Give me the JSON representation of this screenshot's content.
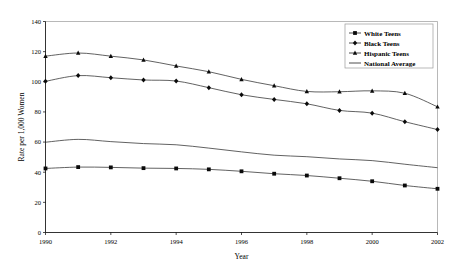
{
  "chart_data": {
    "type": "line",
    "title": "",
    "xlabel": "Year",
    "ylabel": "Rate per 1,000 Women",
    "x": [
      1990,
      1991,
      1992,
      1993,
      1994,
      1995,
      1996,
      1997,
      1998,
      1999,
      2000,
      2001,
      2002
    ],
    "xlim": [
      1990,
      2002
    ],
    "ylim": [
      0,
      140
    ],
    "xticks": [
      1990,
      1992,
      1994,
      1996,
      1998,
      2000,
      2002
    ],
    "xtick_labels": [
      "1990",
      "1992",
      "1994",
      "1996",
      "1998",
      "2000",
      "2002"
    ],
    "yticks": [
      0,
      20,
      40,
      60,
      80,
      100,
      120,
      140
    ],
    "ytick_labels": [
      "0",
      "20",
      "40",
      "60",
      "80",
      "100",
      "120",
      "140"
    ],
    "grid": false,
    "legend_position": "top-right",
    "series": [
      {
        "name": "White Teens",
        "marker": "square",
        "values": [
          42.5,
          43.4,
          43.2,
          42.7,
          42.5,
          41.9,
          40.6,
          39.0,
          37.8,
          36.0,
          34.0,
          31.2,
          29.0
        ]
      },
      {
        "name": "Black Teens",
        "marker": "diamond",
        "values": [
          100.3,
          104.1,
          102.7,
          101.2,
          100.5,
          96.1,
          91.4,
          88.3,
          85.4,
          81.0,
          79.2,
          73.5,
          68.3
        ]
      },
      {
        "name": "Hispanic Teens",
        "marker": "triangle",
        "values": [
          117.0,
          119.1,
          117.0,
          114.5,
          110.5,
          106.7,
          101.6,
          97.4,
          93.6,
          93.4,
          94.0,
          92.4,
          83.4
        ]
      },
      {
        "name": "National Average",
        "marker": "none",
        "values": [
          59.9,
          61.8,
          60.3,
          59.0,
          58.2,
          56.0,
          53.5,
          51.3,
          50.3,
          48.8,
          47.7,
          45.3,
          43.0
        ]
      }
    ]
  },
  "legend": {
    "items": [
      {
        "label": "White Teens"
      },
      {
        "label": "Black Teens"
      },
      {
        "label": "Hispanic Teens"
      },
      {
        "label": "National Average"
      }
    ]
  },
  "axes": {
    "x_title": "Year",
    "y_title": "Rate per 1,000 Women"
  }
}
